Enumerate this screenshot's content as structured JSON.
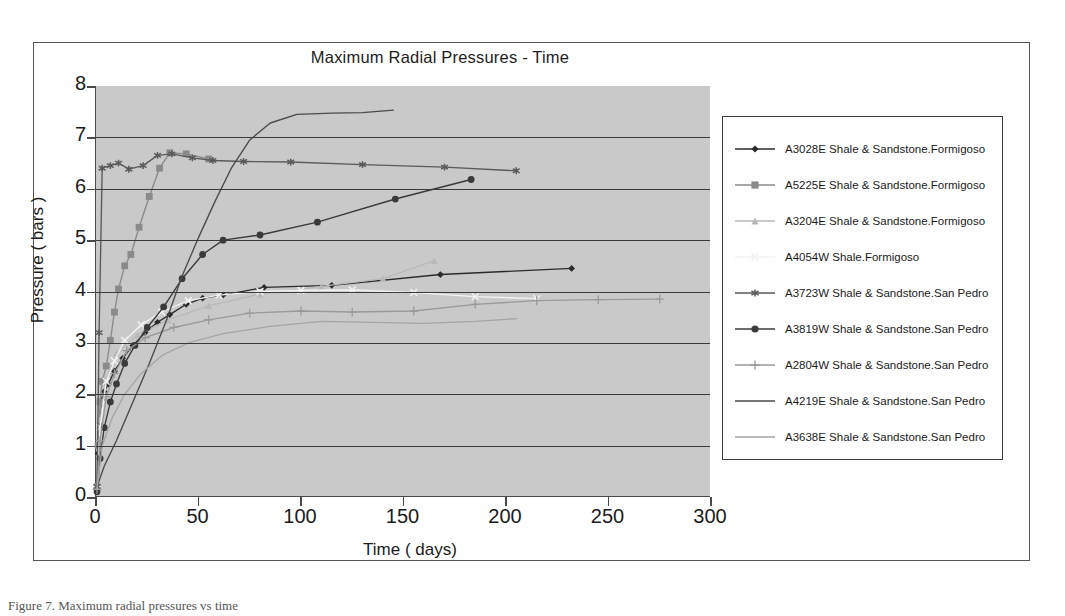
{
  "figure": {
    "caption": "Figure 7.   Maximum radial pressures vs time"
  },
  "chart_data": {
    "type": "line",
    "title": "Maximum Radial Pressures - Time",
    "xlabel": "Time ( days)",
    "ylabel": "Pressure ( bars )",
    "xlim": [
      0,
      300
    ],
    "ylim": [
      0,
      8
    ],
    "xticks": [
      0,
      50,
      100,
      150,
      200,
      250,
      300
    ],
    "yticks": [
      0,
      1,
      2,
      3,
      4,
      5,
      6,
      7,
      8
    ],
    "grid": "horizontal",
    "legend_position": "right-outside",
    "plot_background": "#c9c9c9",
    "series": [
      {
        "name": "A3028E Shale & Sandstone.Formigoso",
        "color": "#2b2b2b",
        "marker": "diamond",
        "points": [
          [
            0.5,
            0.15
          ],
          [
            1,
            0.85
          ],
          [
            2,
            1.45
          ],
          [
            3,
            1.9
          ],
          [
            4,
            2.05
          ],
          [
            6,
            2.2
          ],
          [
            9,
            2.45
          ],
          [
            13,
            2.7
          ],
          [
            18,
            2.95
          ],
          [
            24,
            3.2
          ],
          [
            30,
            3.4
          ],
          [
            36,
            3.55
          ],
          [
            44,
            3.75
          ],
          [
            52,
            3.87
          ],
          [
            62,
            3.93
          ],
          [
            82,
            4.08
          ],
          [
            115,
            4.12
          ],
          [
            168,
            4.33
          ],
          [
            232,
            4.45
          ]
        ]
      },
      {
        "name": "A5225E Shale & Sandstone.Formigoso",
        "color": "#8a8a8a",
        "marker": "square",
        "points": [
          [
            0.5,
            0.2
          ],
          [
            1,
            1.0
          ],
          [
            2,
            1.85
          ],
          [
            3,
            2.25
          ],
          [
            5,
            2.55
          ],
          [
            7,
            3.05
          ],
          [
            9,
            3.6
          ],
          [
            11,
            4.05
          ],
          [
            14,
            4.5
          ],
          [
            17,
            4.72
          ],
          [
            21,
            5.25
          ],
          [
            26,
            5.85
          ],
          [
            31,
            6.4
          ],
          [
            36,
            6.7
          ],
          [
            44,
            6.68
          ],
          [
            55,
            6.58
          ]
        ]
      },
      {
        "name": "A3204E Shale & Sandstone.Formigoso",
        "color": "#b9b9b9",
        "marker": "triangle",
        "points": [
          [
            0.5,
            0.2
          ],
          [
            2,
            1.5
          ],
          [
            5,
            2.3
          ],
          [
            10,
            2.8
          ],
          [
            20,
            3.15
          ],
          [
            35,
            3.45
          ],
          [
            55,
            3.72
          ],
          [
            80,
            3.95
          ],
          [
            110,
            4.1
          ],
          [
            140,
            4.25
          ],
          [
            165,
            4.6
          ]
        ]
      },
      {
        "name": "A4054W Shale.Formigoso",
        "color": "#f2f2f2",
        "marker": "x",
        "points": [
          [
            0.5,
            0.15
          ],
          [
            2,
            1.35
          ],
          [
            5,
            2.25
          ],
          [
            9,
            2.65
          ],
          [
            14,
            3.05
          ],
          [
            22,
            3.35
          ],
          [
            32,
            3.6
          ],
          [
            45,
            3.82
          ],
          [
            60,
            3.93
          ],
          [
            80,
            4.0
          ],
          [
            100,
            4.02
          ],
          [
            125,
            4.03
          ],
          [
            155,
            3.98
          ],
          [
            185,
            3.9
          ],
          [
            215,
            3.86
          ]
        ]
      },
      {
        "name": "A3723W Shale & Sandstone.San Pedro",
        "color": "#5a5a5a",
        "marker": "asterisk",
        "points": [
          [
            0.5,
            0.2
          ],
          [
            1.5,
            3.2
          ],
          [
            3,
            6.4
          ],
          [
            7,
            6.45
          ],
          [
            11,
            6.5
          ],
          [
            16,
            6.38
          ],
          [
            23,
            6.45
          ],
          [
            30,
            6.65
          ],
          [
            37,
            6.68
          ],
          [
            47,
            6.6
          ],
          [
            57,
            6.55
          ],
          [
            72,
            6.53
          ],
          [
            95,
            6.52
          ],
          [
            130,
            6.47
          ],
          [
            170,
            6.42
          ],
          [
            205,
            6.35
          ]
        ]
      },
      {
        "name": "A3819W Shale & Sandstone.San Pedro",
        "color": "#3a3a3a",
        "marker": "circle",
        "points": [
          [
            0.5,
            0.1
          ],
          [
            2,
            0.75
          ],
          [
            4,
            1.35
          ],
          [
            7,
            1.85
          ],
          [
            10,
            2.2
          ],
          [
            14,
            2.6
          ],
          [
            19,
            2.95
          ],
          [
            25,
            3.3
          ],
          [
            33,
            3.7
          ],
          [
            42,
            4.25
          ],
          [
            52,
            4.72
          ],
          [
            62,
            5.0
          ],
          [
            80,
            5.1
          ],
          [
            108,
            5.35
          ],
          [
            146,
            5.8
          ],
          [
            183,
            6.18
          ]
        ]
      },
      {
        "name": "A2804W Shale & Sandstone.San Pedro",
        "color": "#9a9a9a",
        "marker": "plus",
        "points": [
          [
            0.5,
            0.15
          ],
          [
            2,
            1.1
          ],
          [
            5,
            1.95
          ],
          [
            9,
            2.4
          ],
          [
            15,
            2.85
          ],
          [
            24,
            3.1
          ],
          [
            38,
            3.3
          ],
          [
            55,
            3.45
          ],
          [
            75,
            3.58
          ],
          [
            100,
            3.62
          ],
          [
            125,
            3.6
          ],
          [
            155,
            3.62
          ],
          [
            185,
            3.75
          ],
          [
            215,
            3.82
          ],
          [
            245,
            3.84
          ],
          [
            275,
            3.85
          ]
        ]
      },
      {
        "name": "A4219E Shale & Sandstone.San Pedro",
        "color": "#4a4a4a",
        "marker": "none",
        "points": [
          [
            0.5,
            0.2
          ],
          [
            4,
            0.6
          ],
          [
            10,
            1.1
          ],
          [
            18,
            1.85
          ],
          [
            26,
            2.6
          ],
          [
            34,
            3.4
          ],
          [
            42,
            4.3
          ],
          [
            50,
            5.05
          ],
          [
            58,
            5.75
          ],
          [
            66,
            6.4
          ],
          [
            75,
            6.95
          ],
          [
            85,
            7.28
          ],
          [
            98,
            7.45
          ],
          [
            115,
            7.47
          ],
          [
            130,
            7.48
          ],
          [
            145,
            7.53
          ]
        ]
      },
      {
        "name": "A3638E Shale & Sandstone.San Pedro",
        "color": "#a5a5a5",
        "marker": "none",
        "points": [
          [
            0.5,
            0.15
          ],
          [
            3,
            1.0
          ],
          [
            8,
            1.55
          ],
          [
            14,
            2.0
          ],
          [
            22,
            2.4
          ],
          [
            32,
            2.75
          ],
          [
            45,
            3.0
          ],
          [
            62,
            3.18
          ],
          [
            85,
            3.32
          ],
          [
            110,
            3.42
          ],
          [
            135,
            3.4
          ],
          [
            160,
            3.38
          ],
          [
            185,
            3.42
          ],
          [
            205,
            3.47
          ]
        ]
      }
    ]
  }
}
